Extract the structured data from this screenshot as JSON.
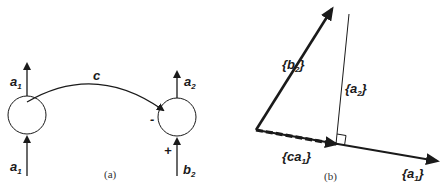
{
  "figure": {
    "panel_a": {
      "caption": "(a)",
      "arc_label": "c",
      "left_node": {
        "output_label": "a",
        "output_sub": "1",
        "input_label": "a",
        "input_sub": "1"
      },
      "right_node": {
        "output_label": "a",
        "output_sub": "2",
        "input_label": "b",
        "input_sub": "2",
        "inhibitory_sign": "-",
        "excitatory_sign": "+"
      }
    },
    "panel_b": {
      "caption": "(b)",
      "vectors": {
        "b2": {
          "open": "{",
          "label": "b",
          "sub": "2",
          "close": "}"
        },
        "a2": {
          "open": "{",
          "label": "a",
          "sub": "2",
          "close": "}"
        },
        "ca1": {
          "open": "{",
          "label": "ca",
          "sub": "1",
          "close": "}"
        },
        "a1": {
          "open": "{",
          "label": "a",
          "sub": "1",
          "close": "}"
        }
      }
    },
    "colors": {
      "ink": "#1a1a1a",
      "background": "#ffffff"
    }
  }
}
